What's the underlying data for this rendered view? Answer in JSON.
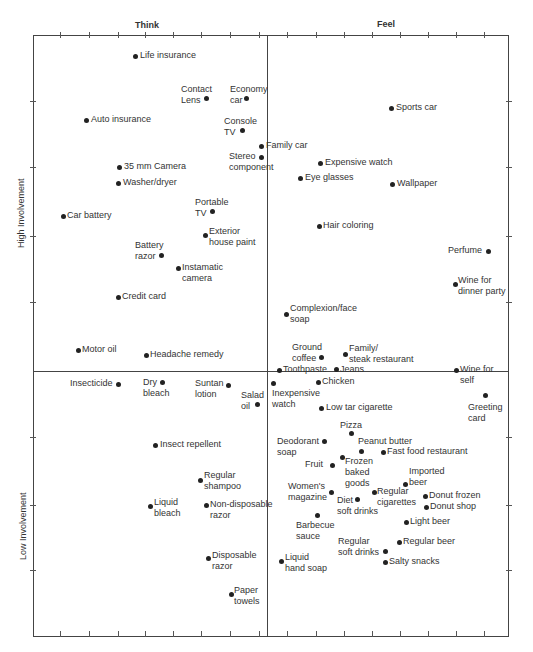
{
  "chart_data": {
    "type": "scatter",
    "title": "",
    "xlabel_left": "Think",
    "xlabel_right": "Feel",
    "ylabel_top": "High Involvement",
    "ylabel_bottom": "Low Involvement",
    "grid": false,
    "quadrant_dividers": {
      "x": 267,
      "y": 371
    },
    "frame": {
      "left": 33,
      "top": 35,
      "right": 509,
      "bottom": 637
    },
    "points": [
      {
        "name": "Life insurance",
        "x": 135,
        "y": 56,
        "lx": 140,
        "ly": 50,
        "align": "left"
      },
      {
        "name": "Contact\nLens",
        "x": 206,
        "y": 98,
        "lx": 181,
        "ly": 84,
        "align": "right"
      },
      {
        "name": "Economy\ncar",
        "x": 246,
        "y": 98,
        "lx": 230,
        "ly": 84,
        "align": "left"
      },
      {
        "name": "Auto insurance",
        "x": 86,
        "y": 120,
        "lx": 91,
        "ly": 114,
        "align": "left"
      },
      {
        "name": "Console\nTV",
        "x": 242,
        "y": 130,
        "lx": 224,
        "ly": 116,
        "align": "left"
      },
      {
        "name": "Family car",
        "x": 261,
        "y": 146,
        "lx": 266,
        "ly": 140,
        "align": "left"
      },
      {
        "name": "Stereo\ncomponent",
        "x": 261,
        "y": 157,
        "lx": 229,
        "ly": 151,
        "align": "left"
      },
      {
        "name": "Sports car",
        "x": 391,
        "y": 108,
        "lx": 396,
        "ly": 102,
        "align": "left"
      },
      {
        "name": "35 mm Camera",
        "x": 119,
        "y": 167,
        "lx": 124,
        "ly": 161,
        "align": "left"
      },
      {
        "name": "Expensive watch",
        "x": 320,
        "y": 163,
        "lx": 325,
        "ly": 157,
        "align": "left"
      },
      {
        "name": "Eye glasses",
        "x": 300,
        "y": 178,
        "lx": 305,
        "ly": 172,
        "align": "left"
      },
      {
        "name": "Washer/dryer",
        "x": 118,
        "y": 183,
        "lx": 123,
        "ly": 177,
        "align": "left"
      },
      {
        "name": "Wallpaper",
        "x": 392,
        "y": 184,
        "lx": 397,
        "ly": 178,
        "align": "left"
      },
      {
        "name": "Portable\nTV",
        "x": 212,
        "y": 211,
        "lx": 195,
        "ly": 197,
        "align": "left"
      },
      {
        "name": "Car battery",
        "x": 63,
        "y": 216,
        "lx": 67,
        "ly": 210,
        "align": "left"
      },
      {
        "name": "Exterior\nhouse paint",
        "x": 205,
        "y": 235,
        "lx": 209,
        "ly": 226,
        "align": "left"
      },
      {
        "name": "Hair coloring",
        "x": 319,
        "y": 226,
        "lx": 323,
        "ly": 220,
        "align": "left"
      },
      {
        "name": "Battery\nrazor",
        "x": 161,
        "y": 255,
        "lx": 135,
        "ly": 240,
        "align": "left"
      },
      {
        "name": "Perfume",
        "x": 488,
        "y": 251,
        "lx": 448,
        "ly": 245,
        "align": "left"
      },
      {
        "name": "Instamatic\ncamera",
        "x": 178,
        "y": 268,
        "lx": 182,
        "ly": 262,
        "align": "left"
      },
      {
        "name": "Wine for\ndinner party",
        "x": 455,
        "y": 284,
        "lx": 458,
        "ly": 275,
        "align": "left"
      },
      {
        "name": "Credit card",
        "x": 118,
        "y": 297,
        "lx": 122,
        "ly": 291,
        "align": "left"
      },
      {
        "name": "Complexion/face\nsoap",
        "x": 286,
        "y": 314,
        "lx": 290,
        "ly": 303,
        "align": "left"
      },
      {
        "name": "Ground\ncoffee",
        "x": 321,
        "y": 357,
        "lx": 292,
        "ly": 342,
        "align": "left"
      },
      {
        "name": "Family/\nsteak restaurant",
        "x": 345,
        "y": 354,
        "lx": 349,
        "ly": 343,
        "align": "left"
      },
      {
        "name": "Motor oil",
        "x": 78,
        "y": 350,
        "lx": 82,
        "ly": 344,
        "align": "left"
      },
      {
        "name": "Headache remedy",
        "x": 146,
        "y": 355,
        "lx": 150,
        "ly": 349,
        "align": "left"
      },
      {
        "name": "Toothpaste",
        "x": 279,
        "y": 370,
        "lx": 283,
        "ly": 364,
        "align": "left"
      },
      {
        "name": "Jeans",
        "x": 336,
        "y": 369,
        "lx": 340,
        "ly": 364,
        "align": "left"
      },
      {
        "name": "Wine for\nself",
        "x": 456,
        "y": 370,
        "lx": 460,
        "ly": 364,
        "align": "left"
      },
      {
        "name": "Insecticide",
        "x": 118,
        "y": 384,
        "lx": 70,
        "ly": 378,
        "align": "left"
      },
      {
        "name": "Dry\nbleach",
        "x": 162,
        "y": 382,
        "lx": 143,
        "ly": 377,
        "align": "left"
      },
      {
        "name": "Suntan\nlotion",
        "x": 228,
        "y": 385,
        "lx": 195,
        "ly": 378,
        "align": "left"
      },
      {
        "name": "Chicken",
        "x": 318,
        "y": 382,
        "lx": 322,
        "ly": 376,
        "align": "left"
      },
      {
        "name": "Inexpensive\nwatch",
        "x": 273,
        "y": 383,
        "lx": 272,
        "ly": 388,
        "align": "left"
      },
      {
        "name": "Salad\noil",
        "x": 257,
        "y": 404,
        "lx": 241,
        "ly": 390,
        "align": "left"
      },
      {
        "name": "Greeting\ncard",
        "x": 485,
        "y": 395,
        "lx": 468,
        "ly": 402,
        "align": "left"
      },
      {
        "name": "Low tar cigarette",
        "x": 321,
        "y": 408,
        "lx": 326,
        "ly": 402,
        "align": "left"
      },
      {
        "name": "Pizza",
        "x": 351,
        "y": 433,
        "lx": 340,
        "ly": 420,
        "align": "left"
      },
      {
        "name": "Insect repellent",
        "x": 155,
        "y": 445,
        "lx": 160,
        "ly": 439,
        "align": "left"
      },
      {
        "name": "Deodorant\nsoap",
        "x": 324,
        "y": 441,
        "lx": 277,
        "ly": 436,
        "align": "left"
      },
      {
        "name": "Peanut butter",
        "x": 361,
        "y": 451,
        "lx": 358,
        "ly": 436,
        "align": "left"
      },
      {
        "name": "Fast food restaurant",
        "x": 383,
        "y": 452,
        "lx": 387,
        "ly": 446,
        "align": "left"
      },
      {
        "name": "Frozen\nbaked\ngoods",
        "x": 342,
        "y": 457,
        "lx": 345,
        "ly": 456,
        "align": "left"
      },
      {
        "name": "Fruit",
        "x": 332,
        "y": 465,
        "lx": 305,
        "ly": 459,
        "align": "left"
      },
      {
        "name": "Regular\nshampoo",
        "x": 200,
        "y": 480,
        "lx": 204,
        "ly": 470,
        "align": "left"
      },
      {
        "name": "Imported\nbeer",
        "x": 405,
        "y": 484,
        "lx": 409,
        "ly": 466,
        "align": "left"
      },
      {
        "name": "Women's\nmagazine",
        "x": 331,
        "y": 492,
        "lx": 288,
        "ly": 481,
        "align": "left"
      },
      {
        "name": "Regular\ncigarettes",
        "x": 374,
        "y": 492,
        "lx": 377,
        "ly": 486,
        "align": "left"
      },
      {
        "name": "Donut frozen",
        "x": 425,
        "y": 496,
        "lx": 429,
        "ly": 490,
        "align": "left"
      },
      {
        "name": "Diet\nsoft drinks",
        "x": 357,
        "y": 499,
        "lx": 337,
        "ly": 495,
        "align": "left"
      },
      {
        "name": "Liquid\nbleach",
        "x": 150,
        "y": 506,
        "lx": 154,
        "ly": 497,
        "align": "left"
      },
      {
        "name": "Non-disposable\nrazor",
        "x": 206,
        "y": 505,
        "lx": 210,
        "ly": 499,
        "align": "left"
      },
      {
        "name": "Donut shop",
        "x": 426,
        "y": 507,
        "lx": 430,
        "ly": 501,
        "align": "left"
      },
      {
        "name": "Barbecue\nsauce",
        "x": 317,
        "y": 515,
        "lx": 296,
        "ly": 520,
        "align": "left"
      },
      {
        "name": "Light beer",
        "x": 406,
        "y": 522,
        "lx": 410,
        "ly": 516,
        "align": "left"
      },
      {
        "name": "Regular beer",
        "x": 399,
        "y": 542,
        "lx": 403,
        "ly": 536,
        "align": "left"
      },
      {
        "name": "Regular\nsoft drinks",
        "x": 385,
        "y": 551,
        "lx": 338,
        "ly": 536,
        "align": "left"
      },
      {
        "name": "Disposable\nrazor",
        "x": 208,
        "y": 558,
        "lx": 212,
        "ly": 550,
        "align": "left"
      },
      {
        "name": "Liquid\nhand soap",
        "x": 281,
        "y": 561,
        "lx": 285,
        "ly": 552,
        "align": "left"
      },
      {
        "name": "Salty snacks",
        "x": 385,
        "y": 562,
        "lx": 389,
        "ly": 556,
        "align": "left"
      },
      {
        "name": "Paper\ntowels",
        "x": 231,
        "y": 594,
        "lx": 234,
        "ly": 585,
        "align": "left"
      }
    ]
  }
}
